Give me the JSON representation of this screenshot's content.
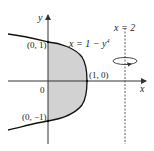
{
  "diagram": {
    "type": "region-of-revolution",
    "curve": {
      "equation": "x = 1 − y⁴",
      "label_main": "x = 1 − y",
      "label_exp": "4"
    },
    "axis_line": {
      "label": "x = 2"
    },
    "axes": {
      "x_label": "x",
      "y_label": "y",
      "origin_label": "0"
    },
    "points": [
      {
        "label": "(0, 1)"
      },
      {
        "label": "(1, 0)"
      },
      {
        "label": "(0, −1)"
      }
    ],
    "colors": {
      "region_fill": "#d4d4d4",
      "stroke": "#1a1a1a",
      "axis": "#444444"
    }
  }
}
